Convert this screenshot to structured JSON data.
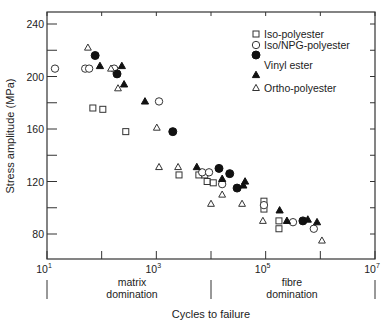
{
  "chart_data": {
    "type": "scatter",
    "title": "",
    "xlabel": "Cycles to failure",
    "ylabel": "Stress amplitude (MPa)",
    "xscale": "log",
    "xlim": [
      10,
      10000000
    ],
    "ylim": [
      60,
      249
    ],
    "x_tick_labels": [
      {
        "base": "10",
        "exp": "1",
        "value": 10
      },
      {
        "base": "10",
        "exp": "3",
        "value": 1000
      },
      {
        "base": "10",
        "exp": "5",
        "value": 100000
      },
      {
        "base": "10",
        "exp": "7",
        "value": 10000000
      }
    ],
    "x_minor_ticks": [
      100,
      10000,
      1000000
    ],
    "y_ticks": [
      80,
      120,
      160,
      200,
      240
    ],
    "y_minor_ticks": [
      100,
      140,
      180,
      220
    ],
    "grid": false,
    "legend_position": "upper right",
    "regions": [
      {
        "label_line1": "matrix",
        "label_line2": "domination",
        "from": 10,
        "to": 10000
      },
      {
        "label_line1": "fibre",
        "label_line2": "domination",
        "from": 10000,
        "to": 10000000
      }
    ],
    "legend": [
      {
        "label": "Iso-polyester",
        "markers": [
          "open-square"
        ]
      },
      {
        "label": "Iso/NPG-polyester",
        "markers": [
          "open-circle"
        ]
      },
      {
        "label": "Vinyl ester",
        "markers": [
          "filled-circle",
          "filled-triangle"
        ]
      },
      {
        "label": "Ortho-polyester",
        "markers": [
          "open-triangle"
        ]
      }
    ],
    "series": [
      {
        "name": "Iso-polyester",
        "marker": "open-square",
        "points": [
          [
            69,
            176
          ],
          [
            105,
            175
          ],
          [
            276,
            158
          ],
          [
            2600,
            125
          ],
          [
            6000,
            125
          ],
          [
            7700,
            125
          ],
          [
            8500,
            120
          ],
          [
            11000,
            119
          ],
          [
            93000,
            105
          ],
          [
            93000,
            99
          ],
          [
            175000,
            90
          ],
          [
            175000,
            84
          ]
        ]
      },
      {
        "name": "Iso/NPG-polyester",
        "marker": "open-circle",
        "points": [
          [
            14,
            206
          ],
          [
            50,
            206
          ],
          [
            59,
            206
          ],
          [
            169,
            206
          ],
          [
            1120,
            181
          ],
          [
            6900,
            127
          ],
          [
            9200,
            127
          ],
          [
            16000,
            118
          ],
          [
            93000,
            102
          ],
          [
            316000,
            89
          ],
          [
            760000,
            84
          ]
        ]
      },
      {
        "name": "Vinyl ester (circle)",
        "marker": "filled-circle",
        "points": [
          [
            76,
            216
          ],
          [
            191,
            202
          ],
          [
            2000,
            158
          ],
          [
            14000,
            130
          ],
          [
            22000,
            126
          ],
          [
            30000,
            115
          ],
          [
            480000,
            90
          ]
        ]
      },
      {
        "name": "Vinyl ester (triangle)",
        "marker": "filled-triangle",
        "points": [
          [
            93,
            208
          ],
          [
            234,
            208
          ],
          [
            257,
            194
          ],
          [
            620,
            181
          ],
          [
            5500,
            131
          ],
          [
            16000,
            122
          ],
          [
            39000,
            117
          ],
          [
            42000,
            120
          ],
          [
            180000,
            98
          ],
          [
            245000,
            90
          ],
          [
            590000,
            91
          ],
          [
            870000,
            89
          ]
        ]
      },
      {
        "name": "Ortho-polyester",
        "marker": "open-triangle",
        "points": [
          [
            56,
            222
          ],
          [
            148,
            206
          ],
          [
            199,
            191
          ],
          [
            1020,
            161
          ],
          [
            1120,
            131
          ],
          [
            2500,
            131
          ],
          [
            16000,
            110
          ],
          [
            10000,
            103
          ],
          [
            37000,
            103
          ],
          [
            89000,
            90
          ],
          [
            1070000,
            75
          ]
        ]
      }
    ]
  }
}
